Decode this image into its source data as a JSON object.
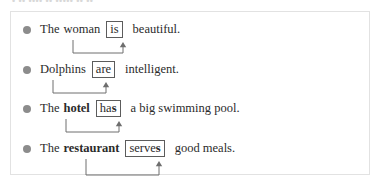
{
  "header": {
    "clipped_text": "• •• •••• •• ••••• •• ••"
  },
  "panel": {
    "border_color": "#e2e2e2",
    "background": "#ffffff"
  },
  "style": {
    "bullet_color": "#8c8c8c",
    "box_border_color": "#5c5c5c",
    "connector_color": "#6e6e6e",
    "text_color": "#2b2b2b"
  },
  "examples": [
    {
      "bullet": "bullet-marker",
      "lead": "The",
      "subject": "woman",
      "subject_bold": false,
      "verb_stem": "is",
      "verb_suffix": "",
      "tail": "beautiful.",
      "connector": {
        "start_x": 62,
        "mid_y": 33,
        "end_x": 112,
        "label": "subject-verb-agreement-arrow"
      }
    },
    {
      "bullet": "bullet-marker",
      "lead": "",
      "subject": "Dolphins",
      "subject_bold": false,
      "verb_stem": "are",
      "verb_suffix": "",
      "tail": "intelligent.",
      "connector": {
        "start_x": 42,
        "mid_y": 33,
        "end_x": 95,
        "label": "subject-verb-agreement-arrow"
      }
    },
    {
      "bullet": "bullet-marker",
      "lead": "The",
      "subject": "hotel",
      "subject_bold": true,
      "verb_stem": "ha",
      "verb_suffix": "s",
      "tail": "a big swimming pool.",
      "connector": {
        "start_x": 55,
        "mid_y": 33,
        "end_x": 108,
        "label": "subject-verb-agreement-arrow"
      }
    },
    {
      "bullet": "bullet-marker",
      "lead": "The",
      "subject": "restaurant",
      "subject_bold": true,
      "verb_stem": "serve",
      "verb_suffix": "s",
      "tail": "good meals.",
      "connector": {
        "start_x": 75,
        "mid_y": 36,
        "end_x": 148,
        "label": "subject-verb-agreement-arrow"
      }
    }
  ]
}
